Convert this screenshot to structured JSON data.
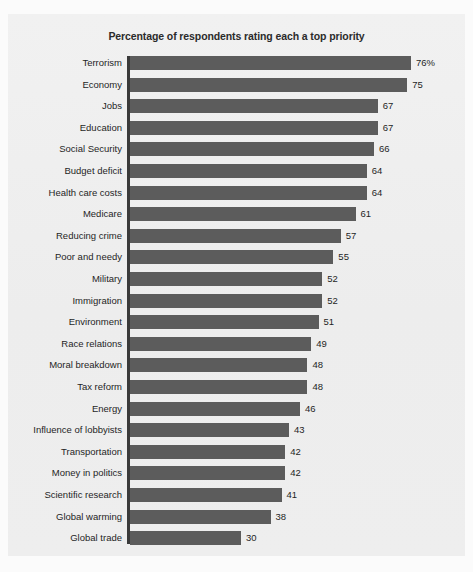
{
  "chart_data": {
    "type": "bar",
    "orientation": "horizontal",
    "title": "Percentage of respondents rating each a top priority",
    "xlabel": "",
    "ylabel": "",
    "xlim": [
      0,
      76
    ],
    "grid": false,
    "legend": null,
    "value_suffix_first": "%",
    "categories": [
      "Terrorism",
      "Economy",
      "Jobs",
      "Education",
      "Social Security",
      "Budget deficit",
      "Health care costs",
      "Medicare",
      "Reducing crime",
      "Poor and needy",
      "Military",
      "Immigration",
      "Environment",
      "Race relations",
      "Moral breakdown",
      "Tax reform",
      "Energy",
      "Influence of lobbyists",
      "Transportation",
      "Money in politics",
      "Scientific research",
      "Global warming",
      "Global trade"
    ],
    "values": [
      76,
      75,
      67,
      67,
      66,
      64,
      64,
      61,
      57,
      55,
      52,
      52,
      51,
      49,
      48,
      48,
      46,
      43,
      42,
      42,
      41,
      38,
      30
    ],
    "value_labels": [
      "76%",
      "75",
      "67",
      "67",
      "66",
      "64",
      "64",
      "61",
      "57",
      "55",
      "52",
      "52",
      "51",
      "49",
      "48",
      "48",
      "46",
      "43",
      "42",
      "42",
      "41",
      "38",
      "30"
    ],
    "colors": {
      "bar": "#5c5c5c",
      "axis": "#3a3a3a",
      "text": "#1f1f1f",
      "title": "#2b2b2b",
      "plot_background": "#efefef",
      "figure_background": "#fbfbfb"
    }
  }
}
